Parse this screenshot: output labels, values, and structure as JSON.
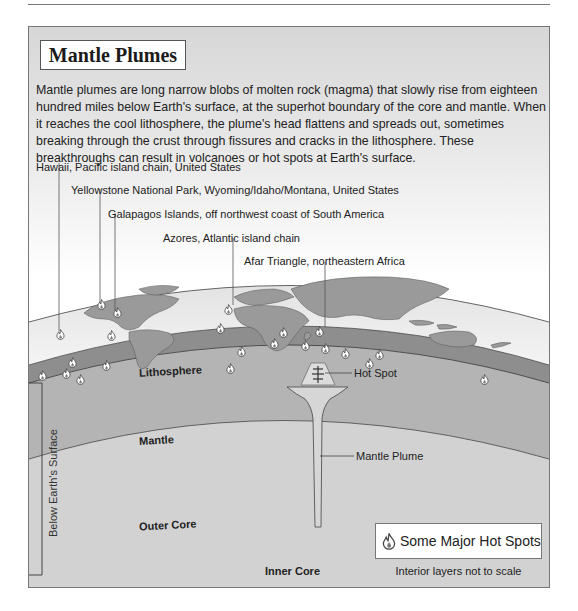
{
  "title": "Mantle Plumes",
  "intro": "Mantle plumes are long narrow blobs of molten rock (magma) that slowly rise from eighteen hundred miles below Earth's surface, at the superhot boundary of the core and mantle.  When it reaches the cool lithosphere, the plume's head flattens and spreads out, sometimes breaking through the crust through fissures and cracks in the lithosphere.  These breakthroughs can result in volcanoes or hot spots at Earth's surface.",
  "callouts": [
    {
      "label": "Hawaii, Pacific island chain, United States"
    },
    {
      "label": "Yellowstone National Park, Wyoming/Idaho/Montana, United States"
    },
    {
      "label": "Galapagos Islands, off northwest coast of South America"
    },
    {
      "label": "Azores, Atlantic island chain"
    },
    {
      "label": "Afar Triangle, northeastern Africa"
    }
  ],
  "layers": {
    "lithosphere": "Lithosphere",
    "mantle": "Mantle",
    "outer_core": "Outer Core",
    "inner_core": "Inner Core"
  },
  "diagram_labels": {
    "hot_spot": "Hot Spot",
    "mantle_plume": "Mantle Plume",
    "below_surface": "Below Earth's Surface"
  },
  "legend": {
    "icon": "flame-icon",
    "label": "Some Major Hot Spots",
    "note": "Interior layers not to scale"
  },
  "colors": {
    "land": "#9a9a9a",
    "ocean": "#ebebeb",
    "lithosphere": "#8e8e8e",
    "mantle": "#b4b4b4",
    "outer_core": "#d2d2d2",
    "inner_core": "#efefef"
  }
}
